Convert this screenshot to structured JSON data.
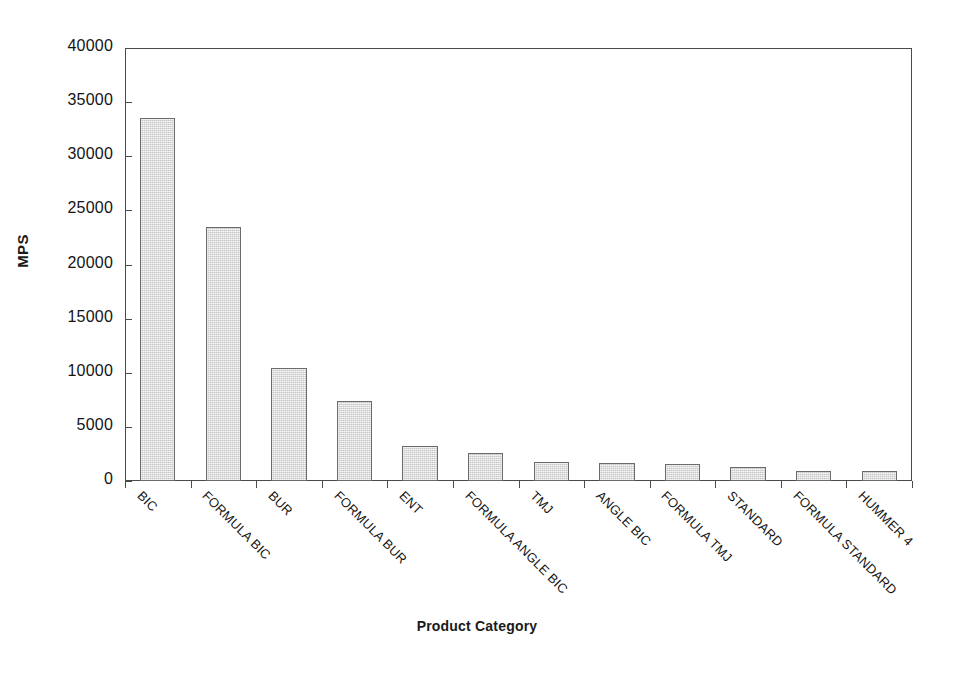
{
  "chart_data": {
    "type": "bar",
    "title": "",
    "xlabel": "Product Category",
    "ylabel": "MPS",
    "categories": [
      "BIC",
      "FORMULA BIC",
      "BUR",
      "FORMULA BUR",
      "ENT",
      "FORMULA ANGLE BIC",
      "TMJ",
      "ANGLE BIC",
      "FORMULA TMJ",
      "STANDARD",
      "FORMULA STANDARD",
      "HUMMER 4"
    ],
    "values": [
      33500,
      23500,
      10400,
      7400,
      3200,
      2600,
      1800,
      1650,
      1550,
      1300,
      950,
      900
    ],
    "ylim": [
      0,
      40000
    ],
    "ytick_values": [
      0,
      5000,
      10000,
      15000,
      20000,
      25000,
      30000,
      35000,
      40000
    ],
    "ytick_labels": [
      "0",
      "5000",
      "10000",
      "15000",
      "20000",
      "25000",
      "30000",
      "35000",
      "40000"
    ],
    "grid": false,
    "legend": null,
    "bar_fill_color": "#d6d6d6",
    "bar_border_color": "#6b6b6b",
    "axis_color": "#4a4a4a",
    "x_label_rotation_deg": 45
  }
}
